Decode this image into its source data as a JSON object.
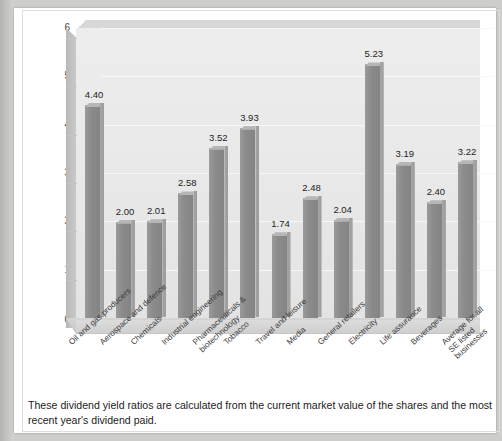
{
  "chart_data": {
    "type": "bar",
    "title": "",
    "xlabel": "",
    "ylabel": "Per cent",
    "ylim": [
      0,
      6
    ],
    "yticks": [
      "0",
      "1",
      "2",
      "3",
      "4",
      "5",
      "6"
    ],
    "grid": true,
    "legend": "none",
    "style": "3d-column",
    "categories": [
      "Oil and gas producers",
      "Aerospace and defence",
      "Chemicals",
      "Industrial engineering",
      "Pharmaceuticals &\nbiotechnology",
      "Tobacco",
      "Travel and leisure",
      "Media",
      "General retailers",
      "Electricity",
      "Life assurance",
      "Beverages",
      "Average for all SE listed\nbusinesses"
    ],
    "values": [
      4.4,
      2.0,
      2.01,
      2.58,
      3.52,
      3.93,
      1.74,
      2.48,
      2.04,
      5.23,
      3.19,
      2.4,
      3.22
    ],
    "value_labels": [
      "4.40",
      "2.00",
      "2.01",
      "2.58",
      "3.52",
      "3.93",
      "1.74",
      "2.48",
      "2.04",
      "5.23",
      "3.19",
      "2.40",
      "3.22"
    ],
    "bar_color": "#8b8b8b",
    "plot_background": "#e8e8e8"
  },
  "caption": {
    "text": "These dividend yield ratios are calculated from the current market value of the shares and the most recent year's dividend paid."
  }
}
